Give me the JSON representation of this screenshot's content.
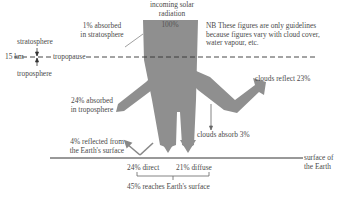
{
  "colors": {
    "flow_fill": "#8f8f8f",
    "line": "#333333",
    "text": "#4a4a4a",
    "background": "#ffffff"
  },
  "incoming": {
    "line1": "incoming solar",
    "line2": "radiation",
    "value": "100%"
  },
  "note": {
    "line1": "NB These figures are only guidelines",
    "line2": "because figures vary with cloud cover,",
    "line3": "water vapour, etc."
  },
  "atmosphere": {
    "stratosphere": "stratosphere",
    "troposphere": "troposphere",
    "height": "15 km",
    "tropopause": "tropopause"
  },
  "flows": {
    "stratosphere_absorbed": {
      "line1": "1% absorbed",
      "line2": "in stratosphere"
    },
    "troposphere_absorbed": {
      "line1": "24% absorbed",
      "line2": "in troposphere"
    },
    "clouds_reflect": "clouds reflect 23%",
    "clouds_absorb": "clouds absorb 3%",
    "surface_reflected": {
      "line1": "4% reflected from",
      "line2": "the Earth's surface"
    },
    "direct": "24% direct",
    "diffuse": "21% diffuse",
    "reaches_surface": "45% reaches Earth's surface"
  },
  "surface": {
    "line1": "surface of",
    "line2": "the Earth"
  }
}
